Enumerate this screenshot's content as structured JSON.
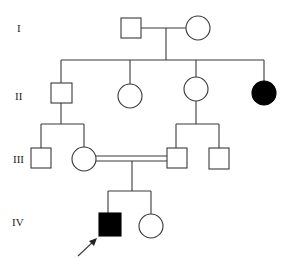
{
  "generations": [
    {
      "label": "I",
      "y": 28
    },
    {
      "label": "II",
      "y": 96
    },
    {
      "label": "III",
      "y": 159
    },
    {
      "label": "IV",
      "y": 222
    }
  ],
  "individuals": [
    {
      "id": "I-1",
      "sex": "male",
      "affected": false
    },
    {
      "id": "I-2",
      "sex": "female",
      "affected": false
    },
    {
      "id": "II-1",
      "sex": "male",
      "affected": false
    },
    {
      "id": "II-2",
      "sex": "female",
      "affected": false
    },
    {
      "id": "II-3",
      "sex": "female",
      "affected": false
    },
    {
      "id": "II-4",
      "sex": "female",
      "affected": true
    },
    {
      "id": "III-1",
      "sex": "male",
      "affected": false
    },
    {
      "id": "III-2",
      "sex": "female",
      "affected": false
    },
    {
      "id": "III-3",
      "sex": "male",
      "affected": false
    },
    {
      "id": "III-4",
      "sex": "male",
      "affected": false
    },
    {
      "id": "IV-1",
      "sex": "male",
      "affected": true,
      "proband": true
    },
    {
      "id": "IV-2",
      "sex": "female",
      "affected": false
    }
  ],
  "relationships": {
    "consanguineous_mating": [
      "III-2",
      "III-3"
    ]
  },
  "colors": {
    "affected": "#000000",
    "unaffected": "#ffffff",
    "line": "#3a3a3a"
  }
}
